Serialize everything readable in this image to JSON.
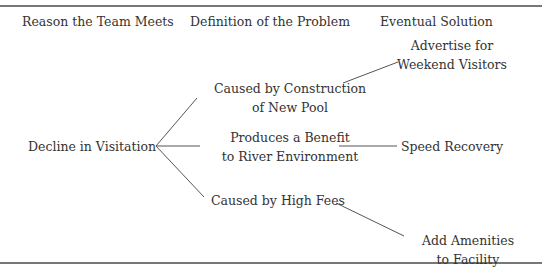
{
  "headers": {
    "reason": "Reason the Team Meets",
    "definition": "Definition of the Problem",
    "solution": "Eventual Solution"
  },
  "root": "Decline in Visitation",
  "problems": [
    {
      "line1": "Caused by Construction",
      "line2": "of New Pool"
    },
    {
      "line1": "Produces a Benefit",
      "line2": "to River Environment"
    },
    {
      "line1": "Caused by High Fees",
      "line2": ""
    }
  ],
  "solutions": [
    {
      "line1": "Advertise for",
      "line2": "Weekend Visitors"
    },
    {
      "line1": "Speed Recovery",
      "line2": ""
    },
    {
      "line1": "Add Amenities",
      "line2": "to Facility"
    }
  ],
  "colors": {
    "text": "#333333",
    "lines": "#555555",
    "rules": "#777777"
  }
}
